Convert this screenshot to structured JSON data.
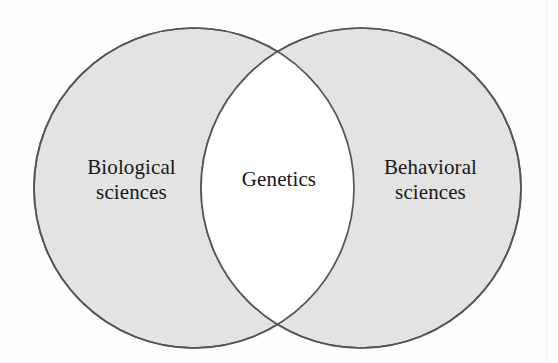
{
  "diagram": {
    "type": "venn",
    "title": "",
    "background_color": "#fefefe",
    "fill_color": "#e3e3e3",
    "stroke_color": "#555555",
    "text_color": "#181818",
    "sets": [
      {
        "id": "left",
        "label_line1": "Biological",
        "label_line2": "sciences",
        "center_x": 194,
        "center_y": 188,
        "radius": 160,
        "filled": true
      },
      {
        "id": "right",
        "label_line1": "Behavioral",
        "label_line2": "sciences",
        "center_x": 361,
        "center_y": 188,
        "radius": 160,
        "filled": true
      }
    ],
    "intersection": {
      "id": "center",
      "label": "Genetics",
      "filled": false,
      "fill_color": "#ffffff"
    }
  },
  "chart_data": {
    "type": "diagram",
    "subtype": "venn-2-set",
    "title": "",
    "categories": [
      "Biological sciences",
      "Behavioral sciences",
      "Genetics"
    ],
    "regions": [
      {
        "name": "Biological sciences",
        "position": "left-only",
        "shaded": true
      },
      {
        "name": "Genetics",
        "position": "intersection",
        "shaded": false
      },
      {
        "name": "Behavioral sciences",
        "position": "right-only",
        "shaded": true
      }
    ],
    "annotations": [
      "Genetics lies at the intersection of the biological sciences and the behavioral sciences."
    ]
  }
}
